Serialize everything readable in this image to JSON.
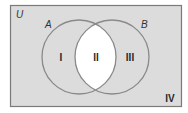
{
  "diagram": {
    "type": "venn",
    "universe": {
      "label": "U",
      "fill": "#dcdcdc",
      "stroke": "#7a7a7a"
    },
    "sets": [
      {
        "label": "A",
        "stroke": "#8a8a8a"
      },
      {
        "label": "B",
        "stroke": "#8a8a8a"
      }
    ],
    "regions": [
      {
        "label": "I",
        "description": "A only"
      },
      {
        "label": "II",
        "description": "A and B (highlighted)",
        "fill": "#ffffff"
      },
      {
        "label": "III",
        "description": "B only"
      },
      {
        "label": "IV",
        "description": "outside A and B"
      }
    ]
  }
}
